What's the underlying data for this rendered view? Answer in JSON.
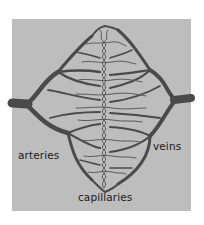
{
  "figure": {
    "background_color": "#bdbdbd",
    "vessel_color": "#4a4a4a",
    "labels": {
      "arteries": "arteries",
      "veins": "veins",
      "capillaries": "capillaries"
    }
  }
}
